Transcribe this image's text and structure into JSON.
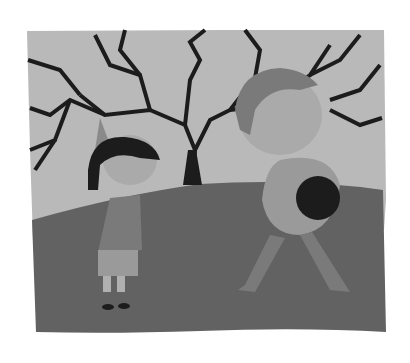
{
  "illustration": {
    "description": "Grayscale painted illustration: a bare tree on a hill, a young girl in a pointed hat looking at a curly-haired woman with glasses walking away carrying a round patterned object",
    "colors": {
      "background": "#ffffff",
      "sky": "#b9b9b9",
      "ground": "#626262",
      "tree": "#1c1c1c",
      "skin": "#b0b0b0",
      "clothes_girl": "#7a7a7a",
      "clothes_woman": "#9a9a9a"
    }
  }
}
